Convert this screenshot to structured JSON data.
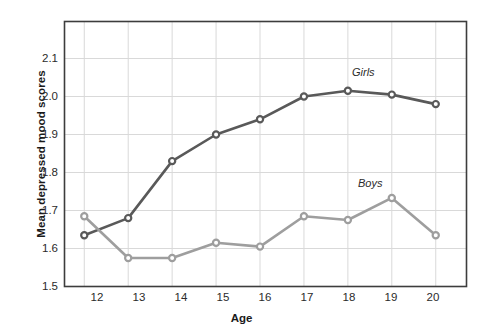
{
  "chart_data": {
    "type": "line",
    "title": "",
    "xlabel": "Age",
    "ylabel": "Mean depressed mood scores",
    "categories": [
      12,
      13,
      14,
      15,
      16,
      17,
      18,
      19,
      20
    ],
    "x": [
      12,
      13,
      14,
      15,
      16,
      17,
      18,
      19,
      20
    ],
    "xlim": [
      11.55,
      20.7
    ],
    "ylim": [
      1.5,
      2.1974
    ],
    "yticks": [
      1.5,
      1.6,
      1.7,
      1.8,
      1.9,
      2.0,
      2.1
    ],
    "ytick_labels": [
      "1.5",
      "1.6",
      "1.7",
      "1.8",
      "1.9",
      "2.0",
      "2.1"
    ],
    "xtick_labels": [
      "12",
      "13",
      "14",
      "15",
      "16",
      "17",
      "18",
      "19",
      "20"
    ],
    "grid": true,
    "legend_position": "inline-annotations",
    "series": [
      {
        "name": "Girls",
        "color": "#595959",
        "marker": "circle",
        "values": [
          1.635,
          1.68,
          1.83,
          1.9,
          1.94,
          2.0,
          2.015,
          2.005,
          1.98
        ]
      },
      {
        "name": "Boys",
        "color": "#9e9e9e",
        "marker": "circle",
        "values": [
          1.685,
          1.575,
          1.575,
          1.615,
          1.605,
          1.685,
          1.675,
          1.733,
          1.635
        ]
      }
    ],
    "annotations": [
      {
        "text": "Girls",
        "x": 17.6,
        "y": 2.055
      },
      {
        "text": "Boys",
        "x": 17.75,
        "y": 1.765
      }
    ],
    "colors": {
      "frame": "#3d3d3d",
      "grid": "#d9d9d9",
      "background": "#ffffff",
      "text": "#1a1a1a"
    }
  }
}
